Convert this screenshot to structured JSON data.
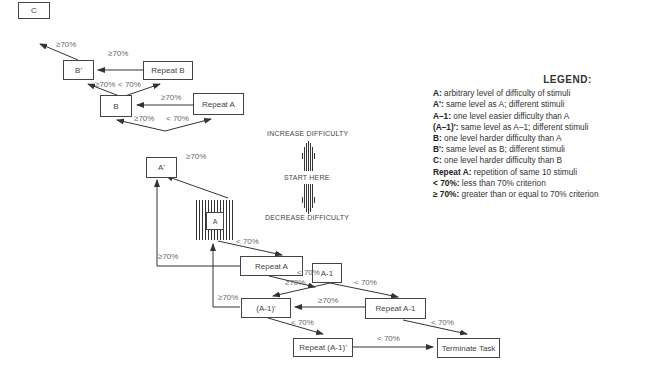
{
  "nodes": {
    "c": "C",
    "b_prime": "B'",
    "repeat_b": "Repeat B",
    "b": "B",
    "repeat_a_top": "Repeat A",
    "a_prime": "A'",
    "a": "A",
    "repeat_a": "Repeat A",
    "a_minus_1": "A-1",
    "a_minus_1_prime": "(A-1)'",
    "repeat_a_minus_1": "Repeat A-1",
    "repeat_a_minus_1_prime": "Repeat (A-1)'",
    "terminate": "Terminate Task"
  },
  "edge_labels": {
    "ge70": "≥70%",
    "lt70": "< 70%"
  },
  "direction": {
    "increase": "INCREASE DIFFICULTY",
    "start": "START HERE",
    "decrease": "DECREASE DIFFICULTY"
  },
  "legend": {
    "title": "LEGEND:",
    "items": [
      {
        "term": "A:",
        "desc": " arbitrary level of difficulty of stimuli"
      },
      {
        "term": "A':",
        "desc": " same level as A; different stimuli"
      },
      {
        "term": "A–1:",
        "desc": " one level easier difficulty than A"
      },
      {
        "term": "(A–1)':",
        "desc": " same level as A–1; different stimuli"
      },
      {
        "term": "B:",
        "desc": " one level harder difficulty than A"
      },
      {
        "term": "B':",
        "desc": " same level as B; different stimuli"
      },
      {
        "term": "C:",
        "desc": " one level harder difficulty than B"
      },
      {
        "term": "Repeat A:",
        "desc": " repetition of same 10 stimuli"
      },
      {
        "term": "< 70%:",
        "desc": " less than 70% criterion"
      },
      {
        "term": "≥ 70%:",
        "desc": " greater than or equal to 70% criterion"
      }
    ]
  }
}
